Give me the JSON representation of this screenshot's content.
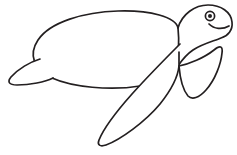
{
  "image": {
    "title": "Sea Turtle Line Drawing",
    "subject": "sea-turtle",
    "style": "black outline coloring-book line art",
    "width": 237,
    "height": 155,
    "background_color": "#ffffff",
    "line_color": "#231f20",
    "line_width": 1.7
  },
  "drawing": {
    "type": "line-art",
    "parts": [
      {
        "name": "shell",
        "label": "Carapace (shell)",
        "description": "Large tilted oval forming the turtle body, slanting down to the left",
        "path": "M 178 28 C 176 17, 150 10, 118 11 C 84 12, 50 22, 38 40 C 28 55, 34 70, 52 78 C 72 87, 110 91, 140 86 C 160 83, 172 74, 176 62 C 179 52, 179 38, 178 28 Z"
      },
      {
        "name": "head",
        "label": "Head",
        "description": "Rounded head at upper right with snout pointing right",
        "path": "M 178 28 C 182 14, 195 5, 208 5 C 221 5, 231 12, 232 22 C 233 30, 228 36, 221 38 C 214 41, 202 44, 193 50 C 187 54, 182 60, 178 66"
      },
      {
        "name": "mouth",
        "label": "Mouth line",
        "description": "Short curved smile line under the eye toward the snout",
        "path": "M 209 24 C 214 29, 222 30, 229 26"
      },
      {
        "name": "eye-outer",
        "label": "Eye outline",
        "description": "Small circle for the eye",
        "shape": "circle",
        "cx": 210,
        "cy": 16,
        "r": 4.6
      },
      {
        "name": "eye-pupil",
        "label": "Eye pupil",
        "description": "Filled dot inside the eye",
        "shape": "circle",
        "cx": 210,
        "cy": 16,
        "r": 2.0
      },
      {
        "name": "front-flipper",
        "label": "Front flipper",
        "description": "Large elongated flipper sweeping down and to the left, tip near bottom center",
        "path": "M 180 44 C 168 56, 150 74, 132 94 C 116 112, 103 130, 99 140 C 97 145, 100 147, 106 145 C 120 140, 145 122, 160 104 C 172 89, 178 76, 179 66"
      },
      {
        "name": "rear-flipper",
        "label": "Rear flipper",
        "description": "Leaf-shaped flipper at right, below the head, pointing down-right",
        "path": "M 179 66 C 189 64, 204 58, 214 50 C 220 45, 223 46, 222 53 C 221 64, 215 80, 206 90 C 199 98, 192 100, 188 96 C 183 90, 180 78, 179 66 Z"
      },
      {
        "name": "rear-flipper-notch",
        "label": "Flipper notch",
        "description": "Short vertical tick where the rear flipper meets the body",
        "path": "M 179 52 L 179 66"
      },
      {
        "name": "tail-flipper",
        "label": "Rear left flipper",
        "description": "Small triangular flipper at far left of the shell",
        "path": "M 40 59 C 30 62, 18 69, 11 77 C 7 82, 9 85, 17 85 C 30 85, 45 82, 53 78"
      }
    ]
  }
}
